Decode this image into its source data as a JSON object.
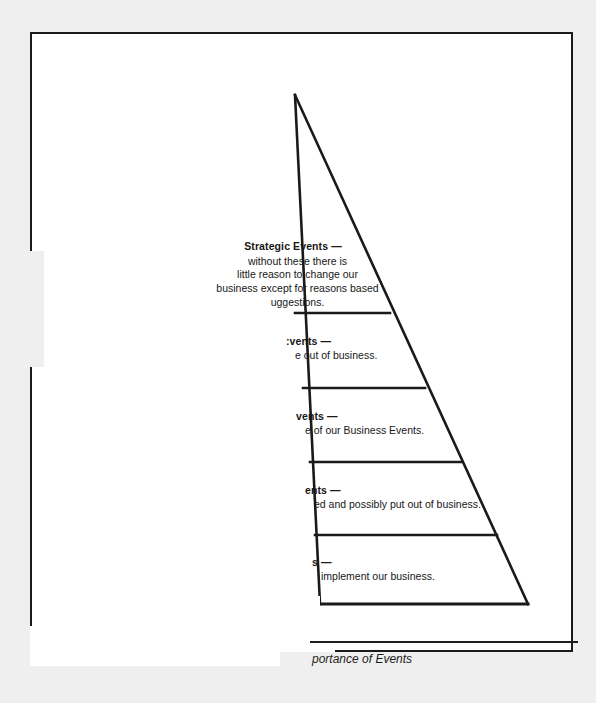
{
  "document": {
    "type": "scanned-page",
    "page_background": "#ffffff",
    "canvas_background": "#efefef",
    "ink_color": "#1a1a1a"
  },
  "figure": {
    "shape": "pyramid",
    "tier_count": 5,
    "caption": "portance of Events",
    "caption_style": "italic",
    "caption_truncated": true
  },
  "tiers": [
    {
      "index": 1,
      "heading": "Strategic Events —",
      "lines": [
        "without these there is",
        "little reason to change our",
        "business except for reasons based",
        "uggestions."
      ],
      "alignment": "center",
      "truncated": true
    },
    {
      "index": 2,
      "heading": ":vents —",
      "lines": [
        "е out of business."
      ],
      "alignment": "left",
      "truncated": true
    },
    {
      "index": 3,
      "heading": "vents —",
      "lines": [
        "е of our Business Events."
      ],
      "alignment": "left",
      "truncated": true
    },
    {
      "index": 4,
      "heading": "ents —",
      "lines": [
        "ed and possibly put out of business."
      ],
      "alignment": "left",
      "truncated": true
    },
    {
      "index": 5,
      "heading": "s —",
      "lines": [
        "implement our business."
      ],
      "alignment": "left",
      "truncated": true
    }
  ],
  "geometry": {
    "apex": {
      "x": 295,
      "y": 95
    },
    "base_left": {
      "x": 320,
      "y": 604
    },
    "base_right": {
      "x": 528,
      "y": 604
    },
    "dividers": [
      {
        "y": 313,
        "x_start": 295,
        "x_end": 390
      },
      {
        "y": 388,
        "x_start": 303,
        "x_end": 425
      },
      {
        "y": 462,
        "x_start": 310,
        "x_end": 462
      },
      {
        "y": 535,
        "x_start": 315,
        "x_end": 497
      }
    ]
  }
}
